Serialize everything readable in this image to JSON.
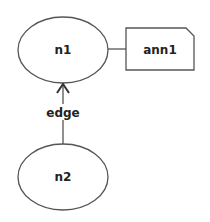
{
  "diagram": {
    "nodes": [
      {
        "id": "n1",
        "label": "n1",
        "shape": "ellipse",
        "cx": 63,
        "cy": 50,
        "rx": 45,
        "ry": 33
      },
      {
        "id": "n2",
        "label": "n2",
        "shape": "ellipse",
        "cx": 63,
        "cy": 177,
        "rx": 45,
        "ry": 33
      }
    ],
    "annotations": [
      {
        "id": "ann1",
        "label": "ann1",
        "shape": "note",
        "attached_to": "n1"
      }
    ],
    "edges": [
      {
        "from": "n2",
        "to": "n1",
        "label": "edge",
        "arrow": "to"
      }
    ],
    "colors": {
      "stroke": "#555555",
      "text": "#222222",
      "background": "#ffffff"
    }
  }
}
